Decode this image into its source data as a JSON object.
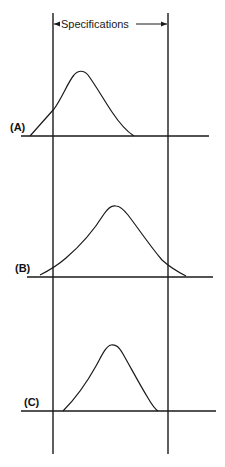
{
  "diagram": {
    "spec_label": "Specifications",
    "spec_limits": {
      "lower_x": 53,
      "upper_x": 168,
      "top_y": 13,
      "bottom_y": 454
    },
    "panels": [
      {
        "id": "A",
        "label": "(A)",
        "label_pos": [
          10,
          131
        ],
        "baseline": {
          "y": 136,
          "x1": 21,
          "x2": 209
        },
        "curve": {
          "start_x": 30,
          "peak_x": 80,
          "peak_y": 72,
          "end_x": 134,
          "description": "Distribution shifted left; left tail outside lower spec limit"
        }
      },
      {
        "id": "B",
        "label": "(B)",
        "label_pos": [
          15,
          272
        ],
        "baseline": {
          "y": 277,
          "x1": 27,
          "x2": 213
        },
        "curve": {
          "start_x": 40,
          "peak_x": 114,
          "peak_y": 206,
          "end_x": 186,
          "description": "Centered but too wide; both tails outside spec limits"
        }
      },
      {
        "id": "C",
        "label": "(C)",
        "label_pos": [
          24,
          406
        ],
        "baseline": {
          "y": 411,
          "x1": 21,
          "x2": 216
        },
        "curve": {
          "start_x": 63,
          "peak_x": 114,
          "peak_y": 345,
          "end_x": 158,
          "description": "Centered and narrow; fully within spec limits"
        }
      }
    ]
  },
  "colors": {
    "ink": "#1a1a1a",
    "background": "#ffffff"
  }
}
